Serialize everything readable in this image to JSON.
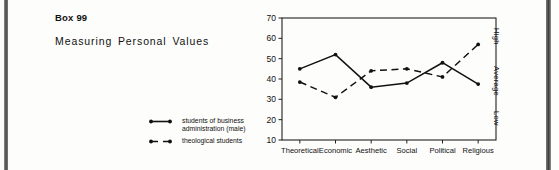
{
  "caption": {
    "box_label": "Box 99",
    "title": "Measuring Personal Values"
  },
  "legend": {
    "items": [
      {
        "label": "students of business\nadministration (male)",
        "style": "solid",
        "marker": "dot"
      },
      {
        "label": "theological students",
        "style": "dashed",
        "marker": "dot"
      }
    ]
  },
  "axis_right": {
    "labels": [
      "High",
      "Average",
      "Low"
    ]
  },
  "chart_data": {
    "type": "line",
    "title": "",
    "xlabel": "",
    "ylabel": "",
    "categories": [
      "Theoretical",
      "Economic",
      "Aesthetic",
      "Social",
      "Political",
      "Religious"
    ],
    "yticks": [
      10,
      20,
      30,
      40,
      50,
      60,
      70
    ],
    "ylim": [
      10,
      70
    ],
    "grid": false,
    "legend_position": "left-outside",
    "series": [
      {
        "name": "students of business administration (male)",
        "style": "solid",
        "values": [
          45,
          52,
          36,
          38,
          48,
          37.5
        ]
      },
      {
        "name": "theological students",
        "style": "dashed",
        "values": [
          38.5,
          31,
          44,
          45,
          41,
          57
        ]
      }
    ],
    "right_axis_labels": [
      "High",
      "Average",
      "Low"
    ]
  }
}
